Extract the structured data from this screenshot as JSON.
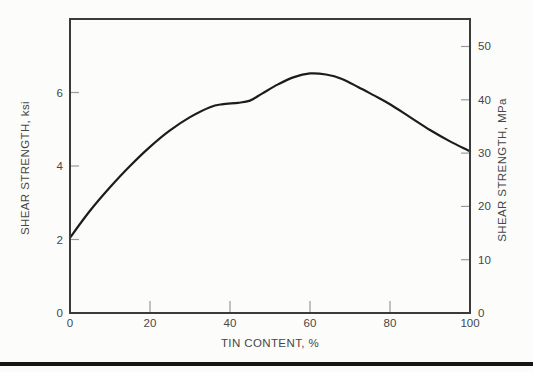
{
  "page": {
    "background": "#fcfcfa",
    "bottom_rule_color": "#161616"
  },
  "chart_data": {
    "type": "line",
    "title": "",
    "xlabel": "TIN CONTENT, %",
    "ylabel_left": "SHEAR STRENGTH, ksi",
    "ylabel_right": "SHEAR STRENGTH, MPa",
    "xlim": [
      0,
      100
    ],
    "ylim_left_ksi": [
      0,
      8
    ],
    "ylim_right_mpa": [
      0,
      55.2
    ],
    "mpa_per_ksi": 6.8948,
    "xticks": [
      0,
      20,
      40,
      60,
      80,
      100
    ],
    "yticks_left": [
      0,
      2,
      4,
      6
    ],
    "yticks_right": [
      0,
      10,
      20,
      30,
      40,
      50
    ],
    "grid": false,
    "legend": false,
    "line_color": "#1c1c1c",
    "axis_color": "#3b3b3b",
    "tick_color": "#9a9a9a",
    "text_color": "#474747",
    "series": [
      {
        "name": "shear strength vs tin content",
        "x": [
          0,
          5,
          10,
          15,
          20,
          25,
          30,
          35,
          38,
          42,
          45,
          48,
          52,
          56,
          60,
          64,
          68,
          72,
          76,
          80,
          85,
          90,
          95,
          100
        ],
        "y_ksi": [
          2.05,
          2.78,
          3.42,
          4.0,
          4.52,
          4.97,
          5.33,
          5.6,
          5.68,
          5.72,
          5.78,
          5.97,
          6.22,
          6.42,
          6.52,
          6.49,
          6.37,
          6.15,
          5.92,
          5.68,
          5.33,
          4.98,
          4.67,
          4.4
        ]
      }
    ]
  }
}
